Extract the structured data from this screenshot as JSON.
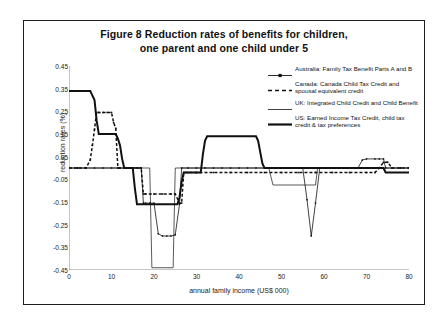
{
  "title": {
    "line1": "Figure 8   Reduction rates of benefits for children,",
    "line2": "one parent and one child under 5"
  },
  "axes": {
    "ylabel": "reduction rates (%)",
    "xlabel": "annual family income (US$ 000)",
    "yticks": [
      "0.45",
      "0.35",
      "0.25",
      "0.15",
      "0.05",
      "-0.05",
      "-0.15",
      "-0.25",
      "-0.35",
      "-0.45"
    ],
    "xticks": [
      "0",
      "10",
      "20",
      "30",
      "40",
      "50",
      "60",
      "70",
      "80"
    ]
  },
  "legend": {
    "items": [
      {
        "label": "Australia: Family Tax Benefit Parts A and B",
        "key": "line-marker-thin"
      },
      {
        "label": "Canada: Canada Child Tax Credit and spousal equivalent credit",
        "key": "line-dashed"
      },
      {
        "label": "UK: Integrated Child Credit and Child Benefit",
        "key": "line-thin"
      },
      {
        "label": "US: Earned Income Tax Credit, child tax credit & tax preferences",
        "key": "line-thick"
      }
    ]
  },
  "colors": {
    "axis": "#6f6f6f",
    "series": "#111111",
    "frame": "#1c1c1c",
    "background": "#ffffff"
  },
  "chart_data": {
    "type": "line",
    "title": "Figure 8   Reduction rates of benefits for children, one parent and one child under 5",
    "xlabel": "annual family income (US$ 000)",
    "ylabel": "reduction rates (%)",
    "xlim": [
      0,
      80
    ],
    "ylim": [
      -0.45,
      0.45
    ],
    "ytick_step": 0.1,
    "xtick_step": 10,
    "grid": false,
    "legend_position": "right-top",
    "series": [
      {
        "name": "Australia: Family Tax Benefit Parts A and B",
        "style": "thin-line-with-square-markers",
        "points": [
          [
            0,
            0.0
          ],
          [
            2,
            0.0
          ],
          [
            4,
            0.0
          ],
          [
            6,
            0.0
          ],
          [
            8,
            0.0
          ],
          [
            10,
            0.0
          ],
          [
            12,
            0.0
          ],
          [
            14,
            0.0
          ],
          [
            16,
            0.0
          ],
          [
            17,
            0.0
          ],
          [
            17.5,
            -0.155
          ],
          [
            18,
            -0.155
          ],
          [
            19,
            -0.155
          ],
          [
            20,
            -0.155
          ],
          [
            21,
            -0.29
          ],
          [
            22,
            -0.3
          ],
          [
            23,
            -0.3
          ],
          [
            24,
            -0.3
          ],
          [
            25,
            -0.295
          ],
          [
            26,
            -0.16
          ],
          [
            26.5,
            0.0
          ],
          [
            28,
            0.0
          ],
          [
            30,
            0.0
          ],
          [
            32,
            0.0
          ],
          [
            34,
            0.0
          ],
          [
            36,
            0.0
          ],
          [
            38,
            0.0
          ],
          [
            40,
            0.0
          ],
          [
            42,
            0.0
          ],
          [
            44,
            0.0
          ],
          [
            46,
            0.0
          ],
          [
            48,
            0.0
          ],
          [
            50,
            0.0
          ],
          [
            52,
            0.0
          ],
          [
            54,
            0.0
          ],
          [
            55,
            0.0
          ],
          [
            56,
            -0.14
          ],
          [
            57,
            -0.3
          ],
          [
            58,
            -0.155
          ],
          [
            59,
            0.0
          ],
          [
            60,
            0.0
          ],
          [
            62,
            0.0
          ],
          [
            64,
            0.0
          ],
          [
            66,
            0.0
          ],
          [
            68,
            0.0
          ],
          [
            69,
            0.035
          ],
          [
            70,
            0.04
          ],
          [
            72,
            0.04
          ],
          [
            73,
            0.04
          ],
          [
            74,
            0.04
          ],
          [
            74.5,
            0.0
          ],
          [
            76,
            0.0
          ],
          [
            78,
            0.0
          ],
          [
            80,
            0.0
          ]
        ]
      },
      {
        "name": "Canada: Canada Child Tax Credit and spousal equivalent credit",
        "style": "dashed-line-with-square-markers",
        "points": [
          [
            0,
            0.0
          ],
          [
            2,
            0.0
          ],
          [
            4,
            0.0
          ],
          [
            5,
            0.035
          ],
          [
            5.5,
            0.1
          ],
          [
            6,
            0.17
          ],
          [
            6.5,
            0.245
          ],
          [
            7,
            0.245
          ],
          [
            8,
            0.245
          ],
          [
            9,
            0.245
          ],
          [
            10,
            0.245
          ],
          [
            10.5,
            0.2
          ],
          [
            11,
            0.175
          ],
          [
            11.5,
            0.0
          ],
          [
            12,
            0.0
          ],
          [
            14,
            0.0
          ],
          [
            16,
            0.0
          ],
          [
            17,
            0.0
          ],
          [
            17.5,
            -0.115
          ],
          [
            18,
            -0.115
          ],
          [
            20,
            -0.115
          ],
          [
            22,
            -0.115
          ],
          [
            24,
            -0.115
          ],
          [
            25,
            -0.115
          ],
          [
            26,
            -0.155
          ],
          [
            26.5,
            -0.155
          ],
          [
            27,
            -0.02
          ],
          [
            28,
            -0.02
          ],
          [
            30,
            -0.02
          ],
          [
            34,
            -0.02
          ],
          [
            38,
            -0.02
          ],
          [
            42,
            -0.02
          ],
          [
            46,
            -0.02
          ],
          [
            50,
            -0.02
          ],
          [
            54,
            -0.02
          ],
          [
            58,
            -0.02
          ],
          [
            62,
            -0.02
          ],
          [
            66,
            -0.02
          ],
          [
            70,
            -0.02
          ],
          [
            72,
            -0.02
          ],
          [
            73,
            0.0
          ],
          [
            74,
            0.025
          ],
          [
            75,
            0.025
          ],
          [
            76,
            0.0
          ],
          [
            78,
            0.0
          ],
          [
            80,
            0.0
          ]
        ]
      },
      {
        "name": "UK: Integrated Child Credit and Child Benefit",
        "style": "thin-line",
        "points": [
          [
            0,
            0.0
          ],
          [
            4,
            0.0
          ],
          [
            8,
            0.0
          ],
          [
            12,
            0.0
          ],
          [
            16,
            0.0
          ],
          [
            18,
            0.0
          ],
          [
            19,
            0.0
          ],
          [
            19.5,
            -0.44
          ],
          [
            20,
            -0.44
          ],
          [
            22,
            -0.44
          ],
          [
            24,
            -0.44
          ],
          [
            24.5,
            -0.44
          ],
          [
            25,
            0.0
          ],
          [
            26,
            0.0
          ],
          [
            28,
            0.0
          ],
          [
            32,
            0.0
          ],
          [
            36,
            0.0
          ],
          [
            40,
            0.0
          ],
          [
            44,
            0.0
          ],
          [
            47,
            0.0
          ],
          [
            48,
            -0.075
          ],
          [
            50,
            -0.075
          ],
          [
            54,
            -0.075
          ],
          [
            57,
            -0.075
          ],
          [
            58,
            -0.075
          ],
          [
            58.5,
            0.0
          ],
          [
            60,
            0.0
          ],
          [
            64,
            0.0
          ],
          [
            68,
            0.0
          ],
          [
            72,
            0.0
          ],
          [
            76,
            0.0
          ],
          [
            80,
            0.0
          ]
        ]
      },
      {
        "name": "US: Earned Income Tax Credit, child tax credit & tax preferences",
        "style": "thick-line",
        "points": [
          [
            0,
            0.34
          ],
          [
            2,
            0.34
          ],
          [
            4,
            0.34
          ],
          [
            5,
            0.34
          ],
          [
            6,
            0.3
          ],
          [
            6.5,
            0.21
          ],
          [
            7,
            0.15
          ],
          [
            8,
            0.15
          ],
          [
            10,
            0.15
          ],
          [
            11,
            0.15
          ],
          [
            11.5,
            0.13
          ],
          [
            12,
            0.1
          ],
          [
            12.5,
            0.04
          ],
          [
            13,
            0.0
          ],
          [
            14,
            0.0
          ],
          [
            15,
            0.0
          ],
          [
            15.5,
            -0.09
          ],
          [
            16,
            -0.16
          ],
          [
            18,
            -0.16
          ],
          [
            20,
            -0.16
          ],
          [
            22,
            -0.16
          ],
          [
            24,
            -0.16
          ],
          [
            25.5,
            -0.16
          ],
          [
            26,
            -0.13
          ],
          [
            26.5,
            -0.06
          ],
          [
            27,
            -0.02
          ],
          [
            28,
            -0.02
          ],
          [
            30,
            -0.02
          ],
          [
            31,
            -0.02
          ],
          [
            31.5,
            0.06
          ],
          [
            32,
            0.12
          ],
          [
            32.5,
            0.14
          ],
          [
            34,
            0.14
          ],
          [
            38,
            0.14
          ],
          [
            42,
            0.14
          ],
          [
            44,
            0.14
          ],
          [
            44.5,
            0.12
          ],
          [
            45,
            0.07
          ],
          [
            45.5,
            0.02
          ],
          [
            46,
            0.0
          ],
          [
            48,
            0.0
          ],
          [
            52,
            0.0
          ],
          [
            56,
            0.0
          ],
          [
            60,
            0.0
          ],
          [
            64,
            0.0
          ],
          [
            68,
            0.0
          ],
          [
            70,
            0.0
          ],
          [
            72,
            0.0
          ],
          [
            74,
            0.0
          ],
          [
            74.5,
            -0.02
          ],
          [
            76,
            -0.02
          ],
          [
            78,
            -0.02
          ],
          [
            80,
            -0.02
          ]
        ]
      }
    ]
  }
}
